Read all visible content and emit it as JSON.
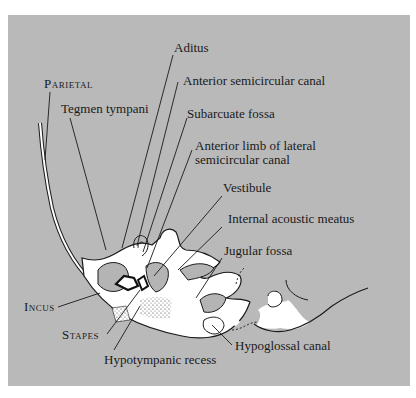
{
  "diagram": {
    "background_color": "#b9b9b9",
    "bone_color": "#ffffff",
    "line_color": "#1a1a1a",
    "labels": {
      "parietal": "Parietal",
      "tegmen_tympani": "Tegmen tympani",
      "aditus": "Aditus",
      "anterior_semicircular_canal": "Anterior semicircular canal",
      "subarcuate_fossa": "Subarcuate fossa",
      "anterior_limb_line1": "Anterior limb of lateral",
      "anterior_limb_line2": "semicircular canal",
      "vestibule": "Vestibule",
      "internal_acoustic_meatus": "Internal acoustic meatus",
      "jugular_fossa": "Jugular fossa",
      "incus": "Incus",
      "stapes": "Stapes",
      "hypotympanic_recess": "Hypotympanic recess",
      "hypoglossal_canal": "Hypoglossal canal"
    }
  }
}
